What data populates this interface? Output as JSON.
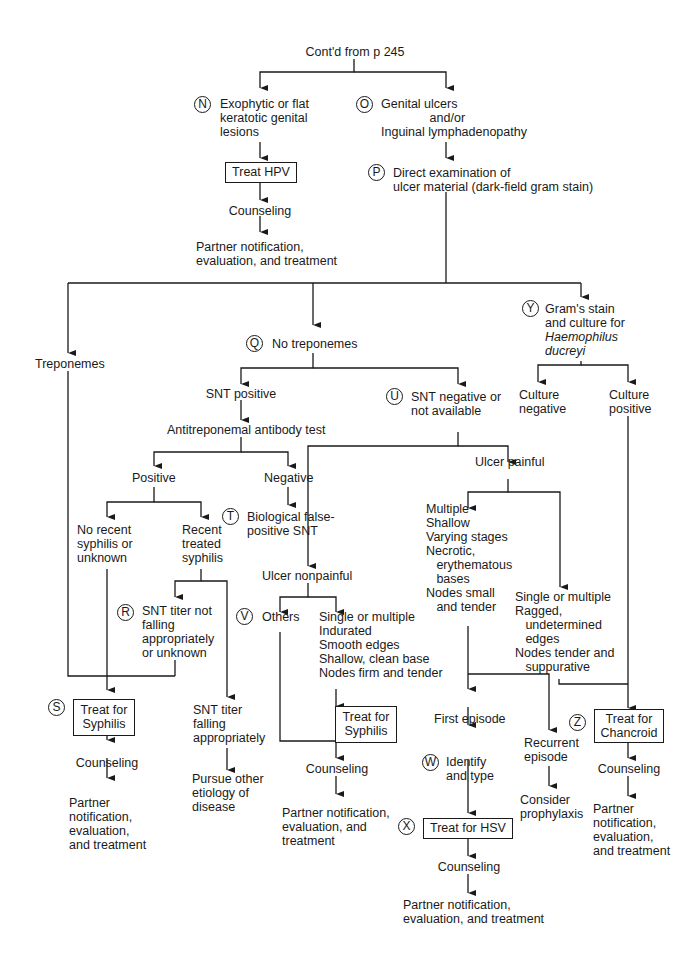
{
  "start": "Cont'd from p 245",
  "nodes": {
    "N": {
      "letter": "N",
      "text": "Exophytic or flat\nkeratotic genital\nlesions"
    },
    "treat_hpv": "Treat HPV",
    "counsel_hpv": "Counseling",
    "partner_hpv": "Partner notification,\nevaluation, and treatment",
    "O": {
      "letter": "O",
      "text": "Genital ulcers\n              and/or\nInguinal lymphadenopathy"
    },
    "P": {
      "letter": "P",
      "text": "Direct examination of\nulcer material (dark-field gram stain)"
    },
    "treponemes": "Treponemes",
    "Q": {
      "letter": "Q",
      "text": "No treponemes"
    },
    "Y": {
      "letter": "Y",
      "text": "Gram's stain\nand culture for",
      "italic": "Haemophilus\nducreyi"
    },
    "snt_positive": "SNT positive",
    "U": {
      "letter": "U",
      "text": "SNT negative or\nnot available"
    },
    "culture_negative": "Culture\nnegative",
    "culture_positive": "Culture\npositive",
    "antibody_test": "Antitreponemal antibody test",
    "ab_positive": "Positive",
    "ab_negative": "Negative",
    "T": {
      "letter": "T",
      "text": "Biological false-\npositive SNT"
    },
    "no_recent": "No recent\nsyphilis or\nunknown",
    "recent_treated": "Recent\ntreated\nsyphilis",
    "R": {
      "letter": "R",
      "text": "SNT titer not\nfalling\nappropriately\nor unknown"
    },
    "snt_falling": "SNT titer\nfalling\nappropriately",
    "pursue_other": "Pursue other\netiology of\ndisease",
    "S": {
      "letter": "S",
      "text": "Treat for\nSyphilis"
    },
    "counsel_syph": "Counseling",
    "partner_syph": "Partner\nnotification,\nevaluation,\nand treatment",
    "ulcer_painful": "Ulcer painful",
    "ulcer_nonpainful": "Ulcer nonpainful",
    "painful_multiple": "Multiple\nShallow\nVarying stages\nNecrotic,\n   erythematous\n   bases\nNodes small\n   and tender",
    "painful_single": "Single or multiple\nRagged,\n   undetermined\n   edges\nNodes tender and\n   suppurative",
    "V": {
      "letter": "V",
      "text": "Others"
    },
    "nonpainful_single": "Single or multiple\nIndurated\nSmooth edges\nShallow, clean base\nNodes firm and tender",
    "treat_syph2": "Treat for\nSyphilis",
    "counsel_mid": "Counseling",
    "partner_mid": "Partner notification,\nevaluation, and\ntreatment",
    "first_episode": "First episode",
    "W": {
      "letter": "W",
      "text": "Identify\nand type"
    },
    "recurrent": "Recurrent\nepisode",
    "prophylaxis": "Consider\nprophylaxis",
    "X": {
      "letter": "X",
      "text": "Treat for HSV"
    },
    "counsel_hsv": "Counseling",
    "partner_hsv": "Partner notification,\nevaluation, and treatment",
    "Z": {
      "letter": "Z",
      "text": "Treat for\nChancroid"
    },
    "counsel_chan": "Counseling",
    "partner_chan": "Partner\nnotification,\nevaluation,\nand treatment"
  },
  "colors": {
    "line": "#1a1a1a",
    "background": "#ffffff"
  }
}
